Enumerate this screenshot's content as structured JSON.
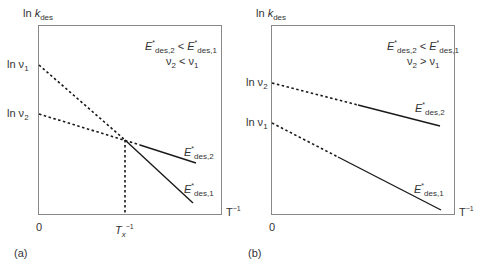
{
  "panels": [
    {
      "tag": "(a)",
      "y_axis_label": {
        "prefix": "ln ",
        "var": "k",
        "sub": "des"
      },
      "x_axis_label": {
        "base": "T",
        "sup": "−1"
      },
      "origin_label": "0",
      "y_ticks": [
        {
          "label": "ln ν",
          "sub": "1"
        },
        {
          "label": "ln ν",
          "sub": "2"
        }
      ],
      "x_tick": {
        "base": "T",
        "sub": "x",
        "sup": "−1"
      },
      "condition_line1": {
        "left_var": "E",
        "left_sub": "des,2",
        "op": " < ",
        "right_var": "E",
        "right_sub": "des,1",
        "sup": "*"
      },
      "condition_line2": {
        "left": "ν",
        "left_sub": "2",
        "op": " < ",
        "right": "ν",
        "right_sub": "1"
      },
      "lines": [
        {
          "label_var": "E",
          "label_sub": "des,2",
          "label_sup": "*"
        },
        {
          "label_var": "E",
          "label_sub": "des,1",
          "label_sup": "*"
        }
      ]
    },
    {
      "tag": "(b)",
      "y_axis_label": {
        "prefix": "ln ",
        "var": "k",
        "sub": "des"
      },
      "x_axis_label": {
        "base": "T",
        "sup": "−1"
      },
      "origin_label": "0",
      "y_ticks": [
        {
          "label": "ln ν",
          "sub": "2"
        },
        {
          "label": "ln ν",
          "sub": "1"
        }
      ],
      "condition_line1": {
        "left_var": "E",
        "left_sub": "des,2",
        "op": " < ",
        "right_var": "E",
        "right_sub": "des,1",
        "sup": "*"
      },
      "condition_line2": {
        "left": "ν",
        "left_sub": "2",
        "op": " > ",
        "right": "ν",
        "right_sub": "1"
      },
      "lines": [
        {
          "label_var": "E",
          "label_sub": "des,2",
          "label_sup": "*"
        },
        {
          "label_var": "E",
          "label_sub": "des,1",
          "label_sup": "*"
        }
      ]
    }
  ],
  "colors": {
    "frame": "#777777",
    "line": "#1a1a1a",
    "text": "#333333"
  }
}
